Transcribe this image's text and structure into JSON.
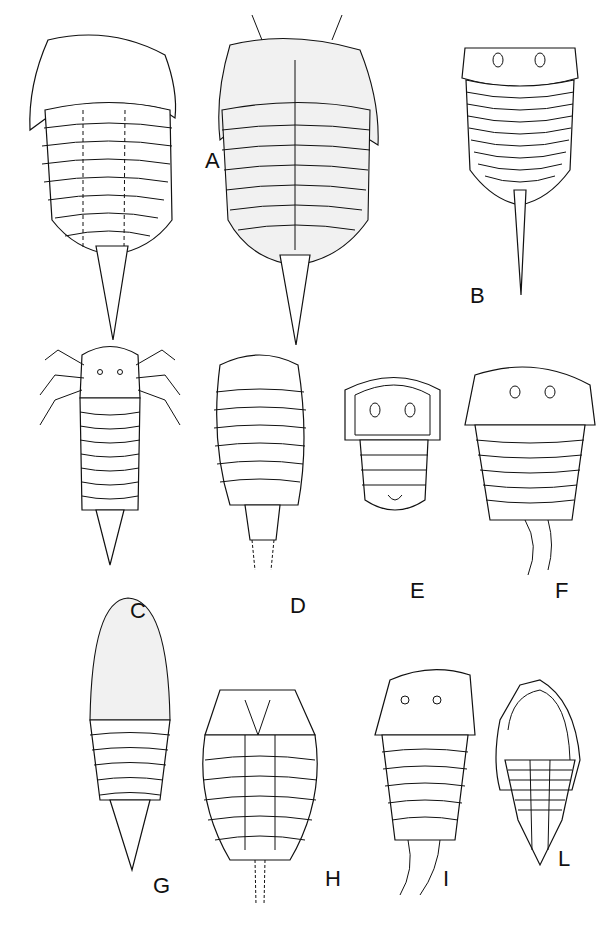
{
  "plate": {
    "type": "scientific illustration plate of arthropod (trilobite-like / aglaspid) body forms",
    "panels": [
      {
        "id": "A",
        "label": "A",
        "description": "dorsal and ventral views, long telson spine"
      },
      {
        "id": "B",
        "label": "B",
        "description": "dorsal view, segmented trunk, tail spine"
      },
      {
        "id": "C",
        "label": "C",
        "description": "dorsal view with antennae and legs, tapering tail"
      },
      {
        "id": "D",
        "label": "D",
        "description": "oval body, segmented, dashed tail"
      },
      {
        "id": "E",
        "label": "E",
        "description": "small shield with two eyes, few segments"
      },
      {
        "id": "F",
        "label": "F",
        "description": "head shield with eyes, segmented trunk, curved tail"
      },
      {
        "id": "G",
        "label": "G",
        "description": "elongate oval, stippled head, spine tail"
      },
      {
        "id": "H",
        "label": "H",
        "description": "ventral view, oval, dashed tail"
      },
      {
        "id": "I",
        "label": "I",
        "description": "head shield with two eyes, segmented trunk"
      },
      {
        "id": "L",
        "label": "L",
        "description": "trilobite with wide cephalic border, spiny pygidium"
      }
    ]
  }
}
